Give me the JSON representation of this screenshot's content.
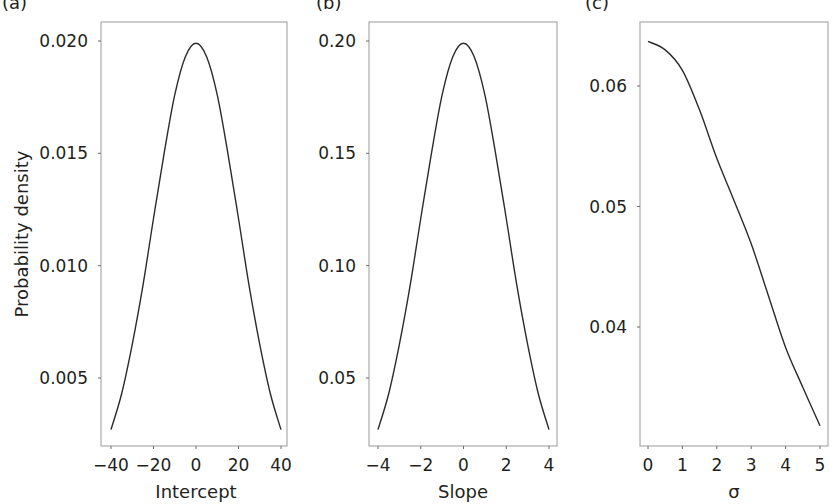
{
  "figure": {
    "ylabel": "Probability density",
    "panels": [
      {
        "label": "(a)",
        "xlabel": "Intercept",
        "xticks": [
          -40,
          -20,
          0,
          20,
          40
        ],
        "xtick_labels": [
          "−40",
          "−20",
          "0",
          "20",
          "40"
        ],
        "yticks": [
          0.005,
          0.01,
          0.015,
          0.02
        ],
        "ytick_labels": [
          "0.005",
          "0.010",
          "0.015",
          "0.020"
        ]
      },
      {
        "label": "(b)",
        "xlabel": "Slope",
        "xticks": [
          -4,
          -2,
          0,
          2,
          4
        ],
        "xtick_labels": [
          "−4",
          "−2",
          "0",
          "2",
          "4"
        ],
        "yticks": [
          0.05,
          0.1,
          0.15,
          0.2
        ],
        "ytick_labels": [
          "0.05",
          "0.10",
          "0.15",
          "0.20"
        ]
      },
      {
        "label": "(c)",
        "xlabel": "σ",
        "xticks": [
          0,
          1,
          2,
          3,
          4,
          5
        ],
        "xtick_labels": [
          "0",
          "1",
          "2",
          "3",
          "4",
          "5"
        ],
        "yticks": [
          0.04,
          0.05,
          0.06
        ],
        "ytick_labels": [
          "0.04",
          "0.05",
          "0.06"
        ]
      }
    ]
  },
  "chart_data": [
    {
      "type": "line",
      "title": "(a)",
      "xlabel": "Intercept",
      "ylabel": "Probability density",
      "xlim": [
        -40,
        40
      ],
      "ylim": [
        0.0027,
        0.02
      ],
      "grid": false,
      "legend": null,
      "description": "Normal density, mean 0, sd 20",
      "x": [
        -40,
        -35,
        -30,
        -25,
        -20,
        -15,
        -10,
        -5,
        0,
        5,
        10,
        15,
        20,
        25,
        30,
        35,
        40
      ],
      "series": [
        {
          "name": "Intercept prior",
          "values": [
            0.0027,
            0.0043,
            0.0065,
            0.0091,
            0.0121,
            0.015,
            0.0176,
            0.0193,
            0.0199,
            0.0193,
            0.0176,
            0.015,
            0.0121,
            0.0091,
            0.0065,
            0.0043,
            0.0027
          ]
        }
      ]
    },
    {
      "type": "line",
      "title": "(b)",
      "xlabel": "Slope",
      "ylabel": "Probability density",
      "xlim": [
        -4,
        4
      ],
      "ylim": [
        0.027,
        0.2
      ],
      "grid": false,
      "legend": null,
      "description": "Normal density, mean 0, sd 2",
      "x": [
        -4,
        -3.5,
        -3,
        -2.5,
        -2,
        -1.5,
        -1,
        -0.5,
        0,
        0.5,
        1,
        1.5,
        2,
        2.5,
        3,
        3.5,
        4
      ],
      "series": [
        {
          "name": "Slope prior",
          "values": [
            0.027,
            0.043,
            0.065,
            0.091,
            0.121,
            0.15,
            0.176,
            0.193,
            0.199,
            0.193,
            0.176,
            0.15,
            0.121,
            0.091,
            0.065,
            0.043,
            0.027
          ]
        }
      ]
    },
    {
      "type": "line",
      "title": "(c)",
      "xlabel": "σ",
      "ylabel": "Probability density",
      "xlim": [
        0,
        5
      ],
      "ylim": [
        0.0318,
        0.0637
      ],
      "grid": false,
      "legend": null,
      "description": "Monotonically decreasing half-density for sigma",
      "x": [
        0,
        0.5,
        1,
        1.5,
        2,
        2.5,
        3,
        3.5,
        4,
        4.5,
        5
      ],
      "series": [
        {
          "name": "Sigma prior",
          "values": [
            0.0637,
            0.063,
            0.0613,
            0.058,
            0.054,
            0.0505,
            0.0469,
            0.0426,
            0.0383,
            0.035,
            0.0318
          ]
        }
      ]
    }
  ]
}
